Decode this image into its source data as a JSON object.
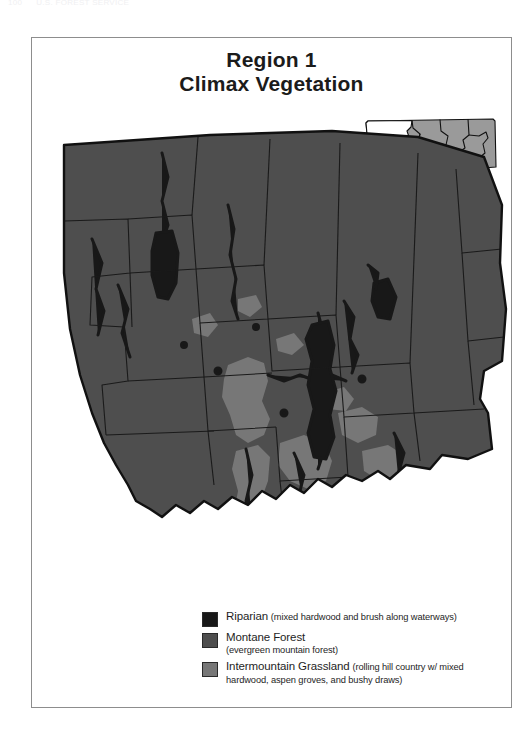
{
  "page": {
    "running_head_left": "100",
    "running_head_right": "U.S. FOREST SERVICE"
  },
  "title": {
    "line1": "Region 1",
    "line2": "Climax Vegetation"
  },
  "colors": {
    "riparian": "#181818",
    "montane_forest": "#4e4e4e",
    "intermountain_grassland": "#777777",
    "outline": "#111111",
    "inset_other_regions": "#9a9a9a",
    "inset_region1": "#ffffff",
    "frame": "#8d8d8d",
    "text": "#1e1e1e"
  },
  "inset": {
    "name": "montana-locator-inset",
    "highlighted_region": "Region 1",
    "highlight_fill": "#ffffff",
    "other_fill": "#9a9a9a"
  },
  "map": {
    "name": "region-1-climax-vegetation-map",
    "base_fill": "#4e4e4e"
  },
  "legend": {
    "items": [
      {
        "swatch": "#181818",
        "swatch_name": "legend-swatch-riparian",
        "name": "Riparian",
        "desc": "(mixed hardwood and brush along waterways)"
      },
      {
        "swatch": "#4e4e4e",
        "swatch_name": "legend-swatch-montane-forest",
        "name": "Montane Forest",
        "desc": "(evergreen mountain forest)"
      },
      {
        "swatch": "#777777",
        "swatch_name": "legend-swatch-intermountain-grassland",
        "name": "Intermountain Grassland",
        "desc": "(rolling hill country w/ mixed hardwood, aspen groves, and bushy draws)"
      }
    ]
  }
}
